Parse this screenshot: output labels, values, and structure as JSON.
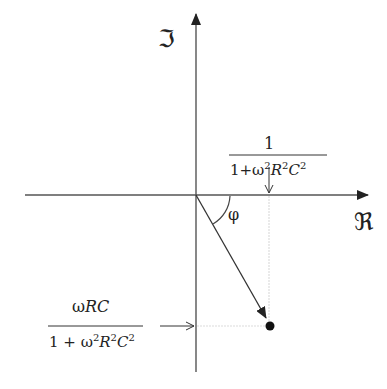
{
  "diagram": {
    "type": "complex-plane phasor diagram",
    "axes": {
      "imaginary_label": "ℑ",
      "real_label": "ℜ"
    },
    "angle_label": "φ",
    "real_part_label": {
      "numerator": "1",
      "denominator_prefix": "1+ω",
      "exp": "2",
      "R": "R",
      "C": "C"
    },
    "imag_part_label": {
      "numerator_omega": "ω",
      "numerator_rc": "RC",
      "denominator_prefix": "1 + ω",
      "exp": "2",
      "R": "R",
      "C": "C"
    },
    "colors": {
      "axis": "#555555",
      "vector": "#333333",
      "guide": "#dddddd",
      "point": "#111111"
    }
  }
}
